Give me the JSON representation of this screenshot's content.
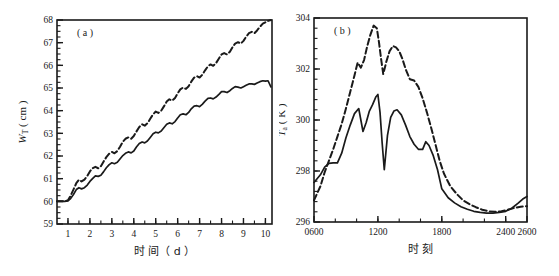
{
  "figure": {
    "background": "#ffffff",
    "ink": "#1a1a1a",
    "panel_count": 2
  },
  "panels": [
    {
      "id": "panel-a",
      "label": "( a )",
      "x_axis_title": "时 间（ d ）",
      "y_axis_title_main": "W",
      "y_axis_title_sub": "T",
      "y_axis_title_unit": "( cm )",
      "x_ticks": [
        "1",
        "2",
        "3",
        "4",
        "5",
        "6",
        "7",
        "8",
        "9",
        "10"
      ],
      "y_ticks": [
        "59",
        "60",
        "61",
        "62",
        "63",
        "64",
        "65",
        "66",
        "67",
        "68"
      ]
    },
    {
      "id": "panel-b",
      "label": "( b )",
      "x_axis_title": "时 刻",
      "y_axis_title_main": "T",
      "y_axis_title_sub": "a",
      "y_axis_title_unit": "( K )",
      "x_ticks": [
        "0600",
        "1200",
        "1800",
        "2400",
        "2600"
      ],
      "y_ticks": [
        "296",
        "298",
        "300",
        "302",
        "304"
      ]
    }
  ],
  "chart_data": [
    {
      "type": "line",
      "id": "panel-a",
      "title": "( a )",
      "xlabel": "时 间（ d ）",
      "ylabel": "W_T ( cm )",
      "xlim": [
        0.5,
        10.3
      ],
      "ylim": [
        59,
        68
      ],
      "xticks": [
        1,
        2,
        3,
        4,
        5,
        6,
        7,
        8,
        9,
        10
      ],
      "yticks": [
        59,
        60,
        61,
        62,
        63,
        64,
        65,
        66,
        67,
        68
      ],
      "grid": false,
      "legend": "none",
      "minor_ticks": true,
      "series": [
        {
          "name": "solid",
          "style": "solid",
          "x": [
            0.5,
            0.7,
            0.85,
            1.0,
            1.12,
            1.25,
            1.38,
            1.5,
            1.62,
            1.75,
            1.88,
            2.0,
            2.12,
            2.25,
            2.38,
            2.5,
            2.62,
            2.75,
            2.88,
            3.0,
            3.12,
            3.25,
            3.38,
            3.5,
            3.62,
            3.75,
            3.88,
            4.0,
            4.12,
            4.25,
            4.38,
            4.5,
            4.62,
            4.75,
            4.88,
            5.0,
            5.12,
            5.25,
            5.38,
            5.5,
            5.62,
            5.75,
            5.88,
            6.0,
            6.12,
            6.25,
            6.38,
            6.5,
            6.62,
            6.75,
            6.88,
            7.0,
            7.12,
            7.25,
            7.38,
            7.5,
            7.62,
            7.75,
            7.88,
            8.0,
            8.12,
            8.25,
            8.38,
            8.5,
            8.62,
            8.75,
            8.88,
            9.0,
            9.12,
            9.25,
            9.38,
            9.5,
            9.62,
            9.75,
            9.88,
            10.0,
            10.12,
            10.25
          ],
          "y": [
            60.0,
            60.0,
            60.0,
            60.02,
            60.12,
            60.3,
            60.52,
            60.6,
            60.55,
            60.6,
            60.72,
            60.88,
            61.0,
            61.12,
            61.1,
            61.15,
            61.3,
            61.48,
            61.62,
            61.7,
            61.66,
            61.72,
            61.88,
            62.02,
            62.12,
            62.18,
            62.14,
            62.22,
            62.4,
            62.55,
            62.62,
            62.58,
            62.66,
            62.82,
            62.98,
            63.05,
            63.02,
            63.1,
            63.26,
            63.4,
            63.46,
            63.42,
            63.52,
            63.68,
            63.82,
            63.86,
            63.82,
            63.92,
            64.08,
            64.2,
            64.22,
            64.18,
            64.28,
            64.42,
            64.54,
            64.56,
            64.52,
            64.6,
            64.72,
            64.84,
            64.84,
            64.8,
            64.88,
            64.98,
            65.06,
            65.04,
            65.0,
            65.06,
            65.12,
            65.18,
            65.18,
            65.16,
            65.22,
            65.28,
            65.32,
            65.3,
            65.32,
            65.05
          ]
        },
        {
          "name": "dashed",
          "style": "dashed",
          "x": [
            0.5,
            0.7,
            0.85,
            1.0,
            1.12,
            1.25,
            1.38,
            1.5,
            1.62,
            1.75,
            1.88,
            2.0,
            2.12,
            2.25,
            2.38,
            2.5,
            2.62,
            2.75,
            2.88,
            3.0,
            3.12,
            3.25,
            3.38,
            3.5,
            3.62,
            3.75,
            3.88,
            4.0,
            4.12,
            4.25,
            4.38,
            4.5,
            4.62,
            4.75,
            4.88,
            5.0,
            5.12,
            5.25,
            5.38,
            5.5,
            5.62,
            5.75,
            5.88,
            6.0,
            6.12,
            6.25,
            6.38,
            6.5,
            6.62,
            6.75,
            6.88,
            7.0,
            7.12,
            7.25,
            7.38,
            7.5,
            7.62,
            7.75,
            7.88,
            8.0,
            8.12,
            8.25,
            8.38,
            8.5,
            8.62,
            8.75,
            8.88,
            9.0,
            9.12,
            9.25,
            9.38,
            9.5,
            9.62,
            9.75,
            9.88,
            10.0,
            10.12,
            10.25
          ],
          "y": [
            60.0,
            60.0,
            60.0,
            60.05,
            60.25,
            60.52,
            60.8,
            60.95,
            60.88,
            60.96,
            61.12,
            61.32,
            61.46,
            61.52,
            61.46,
            61.55,
            61.75,
            61.95,
            62.1,
            62.18,
            62.12,
            62.22,
            62.42,
            62.62,
            62.76,
            62.82,
            62.76,
            62.88,
            63.08,
            63.28,
            63.4,
            63.34,
            63.44,
            63.64,
            63.84,
            63.96,
            63.9,
            64.0,
            64.2,
            64.4,
            64.5,
            64.44,
            64.56,
            64.76,
            64.94,
            65.02,
            64.96,
            65.08,
            65.28,
            65.46,
            65.52,
            65.46,
            65.58,
            65.78,
            65.96,
            66.04,
            65.98,
            66.1,
            66.3,
            66.48,
            66.54,
            66.48,
            66.6,
            66.8,
            66.96,
            67.02,
            66.96,
            67.08,
            67.26,
            67.42,
            67.48,
            67.42,
            67.54,
            67.7,
            67.84,
            67.9,
            67.96,
            68.0
          ]
        }
      ]
    },
    {
      "type": "line",
      "id": "panel-b",
      "title": "( b )",
      "xlabel": "时 刻",
      "ylabel": "T_a ( K )",
      "xlim": [
        600,
        2600
      ],
      "ylim": [
        296,
        304
      ],
      "xticks": [
        600,
        1200,
        1800,
        2400,
        2600
      ],
      "yticks": [
        296,
        298,
        300,
        302,
        304
      ],
      "grid": false,
      "legend": "none",
      "minor_ticks": true,
      "series": [
        {
          "name": "solid",
          "style": "solid",
          "x": [
            600,
            660,
            700,
            740,
            780,
            820,
            860,
            900,
            940,
            980,
            1020,
            1060,
            1090,
            1120,
            1150,
            1180,
            1200,
            1220,
            1240,
            1260,
            1290,
            1320,
            1350,
            1380,
            1420,
            1460,
            1500,
            1540,
            1580,
            1620,
            1650,
            1680,
            1720,
            1760,
            1800,
            1860,
            1920,
            1980,
            2040,
            2100,
            2160,
            2220,
            2280,
            2340,
            2400,
            2460,
            2520,
            2560,
            2600
          ],
          "y": [
            297.55,
            297.85,
            298.15,
            298.3,
            298.32,
            298.32,
            298.7,
            299.3,
            299.8,
            300.25,
            300.45,
            299.55,
            299.9,
            300.35,
            300.6,
            300.9,
            301.0,
            300.3,
            299.1,
            298.05,
            299.4,
            300.1,
            300.35,
            300.4,
            300.2,
            299.8,
            299.35,
            299.05,
            298.85,
            298.85,
            299.15,
            299.0,
            298.6,
            298.05,
            297.3,
            296.95,
            296.75,
            296.6,
            296.5,
            296.42,
            296.38,
            296.35,
            296.35,
            296.38,
            296.42,
            296.55,
            296.75,
            296.9,
            297.0
          ]
        },
        {
          "name": "dashed",
          "style": "dashed",
          "x": [
            600,
            660,
            700,
            740,
            780,
            820,
            860,
            900,
            940,
            980,
            1010,
            1040,
            1070,
            1100,
            1130,
            1160,
            1190,
            1210,
            1230,
            1250,
            1280,
            1310,
            1340,
            1370,
            1400,
            1430,
            1460,
            1500,
            1540,
            1580,
            1620,
            1660,
            1700,
            1740,
            1780,
            1820,
            1880,
            1940,
            2000,
            2060,
            2120,
            2180,
            2240,
            2300,
            2360,
            2420,
            2480,
            2540,
            2600
          ],
          "y": [
            296.85,
            297.4,
            297.95,
            298.4,
            298.85,
            299.35,
            299.85,
            300.45,
            301.1,
            301.75,
            302.25,
            302.05,
            302.35,
            302.9,
            303.35,
            303.7,
            303.6,
            303.05,
            302.4,
            301.8,
            302.3,
            302.7,
            302.9,
            302.85,
            302.7,
            302.4,
            302.0,
            301.6,
            301.55,
            301.3,
            300.85,
            300.3,
            299.7,
            299.05,
            298.4,
            297.9,
            297.4,
            297.1,
            296.85,
            296.7,
            296.58,
            296.48,
            296.42,
            296.4,
            296.42,
            296.48,
            296.55,
            296.6,
            296.62
          ]
        }
      ]
    }
  ]
}
